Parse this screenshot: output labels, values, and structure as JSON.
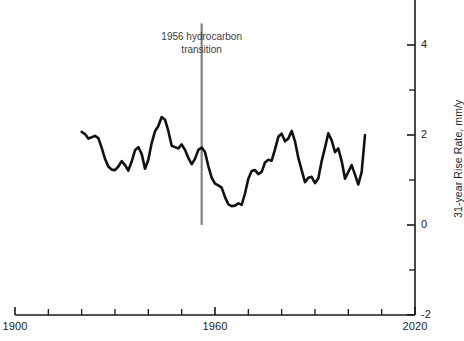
{
  "chart_data": {
    "type": "line",
    "title": "",
    "subtitle": "",
    "xlabel": "",
    "ylabel": "31-year Rise Rate, mm/y",
    "xlim": [
      1900,
      2020
    ],
    "ylim": [
      -2,
      5.1
    ],
    "grid": false,
    "legend": null,
    "x_ticks_major": [
      1900,
      1960,
      2020
    ],
    "x_tick_labels": [
      "1900",
      "1960",
      "2020"
    ],
    "x_ticks_minor": [
      1910,
      1920,
      1930,
      1940,
      1950,
      1970,
      1980,
      1990,
      2000,
      2010
    ],
    "y_ticks_major": [
      -2,
      0,
      2,
      4
    ],
    "y_tick_labels": [
      "-2",
      "0",
      "2",
      "4"
    ],
    "y_ticks_minor": [
      -1,
      1,
      3
    ],
    "series": [
      {
        "name": "31-year rise rate",
        "color": "#111111",
        "line_width": 2.6,
        "x": [
          1920,
          1921,
          1922,
          1923,
          1924,
          1925,
          1926,
          1927,
          1928,
          1929,
          1930,
          1931,
          1932,
          1933,
          1934,
          1935,
          1936,
          1937,
          1938,
          1939,
          1940,
          1941,
          1942,
          1943,
          1944,
          1945,
          1946,
          1947,
          1948,
          1949,
          1950,
          1951,
          1952,
          1953,
          1954,
          1955,
          1956,
          1957,
          1958,
          1959,
          1960,
          1961,
          1962,
          1963,
          1964,
          1965,
          1966,
          1967,
          1968,
          1969,
          1970,
          1971,
          1972,
          1973,
          1974,
          1975,
          1976,
          1977,
          1978,
          1979,
          1980,
          1981,
          1982,
          1983,
          1984,
          1985,
          1986,
          1987,
          1988,
          1989,
          1990,
          1991,
          1992,
          1993,
          1994,
          1995,
          1996,
          1997,
          1998,
          1999,
          2000,
          2001,
          2002,
          2003,
          2004,
          2005
        ],
        "values": [
          2.07,
          2.02,
          1.92,
          1.95,
          1.98,
          1.93,
          1.72,
          1.47,
          1.3,
          1.23,
          1.22,
          1.3,
          1.42,
          1.33,
          1.21,
          1.41,
          1.66,
          1.73,
          1.58,
          1.25,
          1.45,
          1.82,
          2.08,
          2.2,
          2.4,
          2.34,
          2.09,
          1.76,
          1.73,
          1.7,
          1.79,
          1.67,
          1.49,
          1.35,
          1.47,
          1.67,
          1.72,
          1.62,
          1.31,
          1.05,
          0.92,
          0.88,
          0.83,
          0.62,
          0.46,
          0.42,
          0.43,
          0.48,
          0.45,
          0.7,
          1.03,
          1.2,
          1.22,
          1.13,
          1.18,
          1.39,
          1.45,
          1.43,
          1.68,
          1.96,
          2.03,
          1.86,
          1.92,
          2.09,
          1.86,
          1.49,
          1.22,
          0.95,
          1.05,
          1.07,
          0.93,
          1.04,
          1.42,
          1.72,
          2.04,
          1.88,
          1.62,
          1.7,
          1.42,
          1.03,
          1.18,
          1.33,
          1.12,
          0.9,
          1.18,
          2.0
        ]
      }
    ],
    "annotations": [
      {
        "name": "hydrocarbon-transition",
        "text_lines": [
          "1956 hydrocarbon",
          "transition"
        ],
        "x": 1956,
        "line_y_top": 4.48,
        "line_y_bottom": 0.0,
        "line_color": "#808080",
        "text_color": "#3d3d3d"
      }
    ],
    "axis_color": "#1a1a1a",
    "spines": [
      "bottom",
      "right"
    ]
  }
}
